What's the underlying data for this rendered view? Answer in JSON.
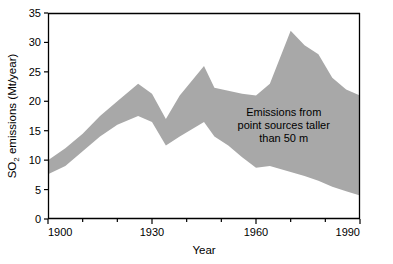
{
  "chart_data": {
    "type": "area",
    "title": "",
    "xlabel": "Year",
    "ylabel": "SO2 emissions (Mt/year)",
    "ylabel_parts": {
      "prefix": "SO",
      "subscript": "2",
      "suffix": " emissions (Mt/year)"
    },
    "xlim": [
      1900,
      1990
    ],
    "ylim": [
      0,
      35
    ],
    "xticks": [
      1900,
      1930,
      1960,
      1990
    ],
    "xticklabels": [
      "1900",
      "1930",
      "1960",
      "1990"
    ],
    "xminorticks": [
      1910,
      1920,
      1940,
      1950,
      1970,
      1980
    ],
    "yticks": [
      0,
      5,
      10,
      15,
      20,
      25,
      30,
      35
    ],
    "yticklabels": [
      "0",
      "5",
      "10",
      "15",
      "20",
      "25",
      "30",
      "35"
    ],
    "grid": false,
    "legend": "none",
    "fill_color": "#a8a8a8",
    "axis_color": "#000000",
    "background_color": "#ffffff",
    "annotations": [
      {
        "lines": [
          "Emissions from",
          "point sources taller",
          "than 50 m"
        ],
        "x": 1968,
        "y": 17.5,
        "align": "center"
      }
    ],
    "series": [
      {
        "name": "Upper bound (total SO2 emissions)",
        "x": [
          1900,
          1905,
          1910,
          1915,
          1920,
          1926,
          1930,
          1934,
          1938,
          1945,
          1948,
          1952,
          1956,
          1960,
          1964,
          1970,
          1974,
          1978,
          1982,
          1986,
          1990
        ],
        "values": [
          10.0,
          12.0,
          14.5,
          17.5,
          20.0,
          23.0,
          21.3,
          17.0,
          21.0,
          26.0,
          22.3,
          21.8,
          21.3,
          21.0,
          23.0,
          32.0,
          29.5,
          28.0,
          24.0,
          22.0,
          21.0
        ]
      },
      {
        "name": "Lower bound (emissions from point sources taller than 50 m)",
        "x": [
          1900,
          1905,
          1910,
          1915,
          1920,
          1926,
          1930,
          1934,
          1938,
          1945,
          1948,
          1952,
          1956,
          1960,
          1964,
          1970,
          1974,
          1978,
          1982,
          1986,
          1990
        ],
        "values": [
          7.6,
          9.0,
          11.5,
          14.0,
          16.0,
          17.5,
          16.5,
          12.5,
          14.0,
          16.5,
          14.0,
          12.5,
          10.5,
          8.7,
          9.0,
          8.0,
          7.3,
          6.5,
          5.5,
          4.7,
          4.0
        ]
      }
    ]
  }
}
